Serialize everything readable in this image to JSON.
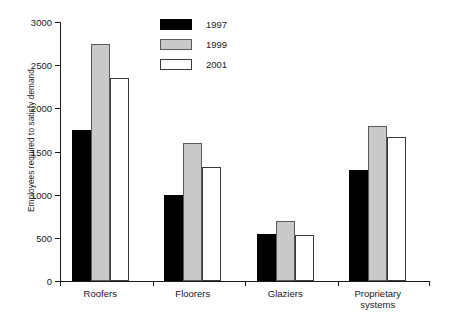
{
  "chart_data": {
    "type": "bar",
    "title": "",
    "subtitle": "",
    "xlabel": "",
    "ylabel": "Employees required to satisfy demand",
    "categories": [
      "Roofers",
      "Floorers",
      "Glaziers",
      "Proprietary\nsystems"
    ],
    "series": [
      {
        "name": "1997",
        "color": "#000000",
        "values": [
          1750,
          1000,
          545,
          1290
        ]
      },
      {
        "name": "1999",
        "color": "#c9c9c9",
        "values": [
          2750,
          1600,
          690,
          1790
        ]
      },
      {
        "name": "2001",
        "color": "#ffffff",
        "values": [
          2350,
          1320,
          535,
          1670
        ]
      }
    ],
    "ylim": [
      0,
      3000
    ],
    "yticks": [
      0,
      500,
      1000,
      1500,
      2000,
      2500,
      3000
    ],
    "ytick_labels": [
      "0",
      "500",
      "1000",
      "1500",
      "2000",
      "2500",
      "3000"
    ],
    "grid": false,
    "legend_position": "top-center",
    "legend_entries": [
      "1997",
      "1999",
      "2001"
    ]
  }
}
